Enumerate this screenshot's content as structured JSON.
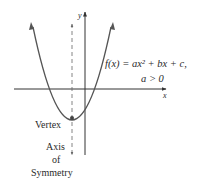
{
  "diagram": {
    "type": "parabola-graph",
    "axes": {
      "x_label": "x",
      "y_label": "y"
    },
    "function_label": {
      "line1": "f(x) = ax² + bx + c,",
      "line2": "a > 0"
    },
    "vertex_label": "Vertex",
    "axis_of_symmetry_label": {
      "line1": "Axis",
      "line2": "of",
      "line3": "Symmetry"
    },
    "colors": {
      "curve": "#555555",
      "axes": "#333333",
      "dashed": "#666666",
      "text": "#2a2a2a"
    }
  }
}
